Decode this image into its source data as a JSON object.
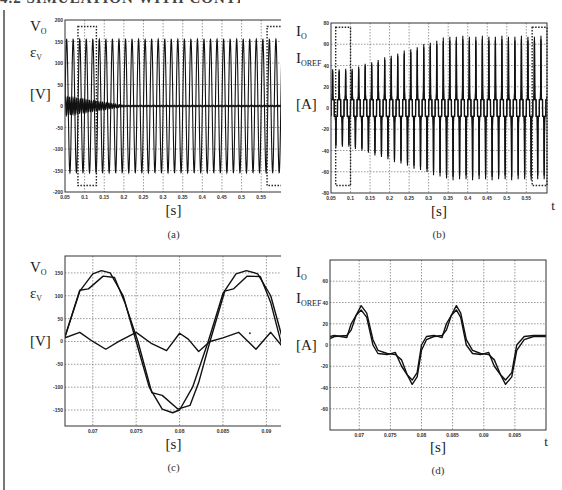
{
  "page": {
    "header_fragment": "4.2  SIMULATION WITH CONTROLLERS"
  },
  "chart_data": [
    {
      "id": "a",
      "type": "line",
      "caption": "(a)",
      "title": "",
      "ylabel_lines": [
        "V_O",
        "ε_V",
        "[V]"
      ],
      "xlabel": "[s]",
      "x_axis_symbol": "t",
      "xlim": [
        0.05,
        0.603
      ],
      "ylim": [
        -200,
        200
      ],
      "xticks": [
        0.05,
        0.1,
        0.15,
        0.2,
        0.25,
        0.3,
        0.35,
        0.4,
        0.45,
        0.5,
        0.55
      ],
      "xtick_labels": [
        "0.05",
        "0.1",
        "0.15",
        "0.2",
        "0.25",
        "0.3",
        "0.35",
        "0.4",
        "0.45",
        "0.5",
        "0.55"
      ],
      "yticks": [
        -200,
        -150,
        -100,
        -50,
        0,
        50,
        100,
        150,
        200
      ],
      "ytick_labels": [
        "-200",
        "-150",
        "-100",
        "-50",
        "0",
        "50",
        "100",
        "150",
        "200"
      ],
      "grid": true,
      "series": [
        {
          "name": "V_O",
          "description": "sinusoidal output voltage, 60 Hz, amplitude ~155 V",
          "amplitude": 155,
          "frequency_hz": 60
        },
        {
          "name": "ε_V",
          "description": "voltage error, ~±20 V initially decaying to ~0 by t≈0.2 s",
          "initial_amplitude": 20,
          "decay_end": 0.2
        }
      ],
      "annotations": [
        {
          "type": "dotted-box",
          "x": [
            0.083,
            0.13
          ],
          "y": [
            -185,
            185
          ]
        },
        {
          "type": "dotted-box",
          "x": [
            0.565,
            0.603
          ],
          "y": [
            -185,
            185
          ]
        }
      ]
    },
    {
      "id": "b",
      "type": "line",
      "caption": "(b)",
      "title": "",
      "ylabel_lines": [
        "I_O",
        "I_OREF",
        "[A]"
      ],
      "xlabel": "[s]",
      "x_axis_symbol": "t",
      "xlim": [
        0.05,
        0.603
      ],
      "ylim": [
        -80,
        80
      ],
      "xticks": [
        0.05,
        0.1,
        0.15,
        0.2,
        0.25,
        0.3,
        0.35,
        0.4,
        0.45,
        0.5,
        0.55
      ],
      "xtick_labels": [
        "0.05",
        "0.1",
        "0.15",
        "0.2",
        "0.25",
        "0.3",
        "0.35",
        "0.4",
        "0.45",
        "0.5",
        "0.55"
      ],
      "yticks": [
        -80,
        -60,
        -40,
        -20,
        0,
        20,
        40,
        60,
        80
      ],
      "ytick_labels": [
        "-80",
        "-60",
        "-40",
        "-20",
        "0",
        "20",
        "40",
        "60",
        "80"
      ],
      "grid": true,
      "series": [
        {
          "name": "I_O",
          "description": "pulsed nonlinear load current, peak ~37 A until t≈0.1 s, then growing to ~68 A by t≈0.35 s",
          "peak_start": 37,
          "peak_end": 68
        },
        {
          "name": "I_OREF",
          "description": "reference current, overlaps I_O"
        }
      ],
      "annotations": [
        {
          "type": "dotted-box",
          "x": [
            0.062,
            0.1
          ],
          "y": [
            -73,
            76
          ]
        },
        {
          "type": "dotted-box",
          "x": [
            0.565,
            0.603
          ],
          "y": [
            -73,
            76
          ]
        }
      ]
    },
    {
      "id": "c",
      "type": "line",
      "caption": "(c)",
      "title": "",
      "ylabel_lines": [
        "V_O",
        "ε_V",
        "[V]"
      ],
      "xlabel": "[s]",
      "x_axis_symbol": "t",
      "xlim": [
        0.0668,
        0.0918
      ],
      "ylim": [
        -185,
        187
      ],
      "xticks": [
        0.07,
        0.075,
        0.08,
        0.085,
        0.09
      ],
      "xtick_labels": [
        "0.07",
        "0.075",
        "0.08",
        "0.085",
        "0.09"
      ],
      "yticks": [
        -150,
        -100,
        -50,
        0,
        50,
        100,
        150
      ],
      "ytick_labels": [
        "-150",
        "-100",
        "-50",
        "0",
        "50",
        "100",
        "150"
      ],
      "grid": true,
      "series": [
        {
          "name": "V_O",
          "x": [
            0.0668,
            0.0685,
            0.07,
            0.071,
            0.072,
            0.0735,
            0.075,
            0.0765,
            0.078,
            0.0792,
            0.08,
            0.0815,
            0.0833,
            0.085,
            0.0865,
            0.0877,
            0.089,
            0.0905,
            0.0918
          ],
          "y": [
            10,
            110,
            148,
            155,
            150,
            100,
            0,
            -100,
            -148,
            -156,
            -150,
            -100,
            0,
            105,
            148,
            155,
            148,
            100,
            10
          ]
        },
        {
          "name": "V_REF",
          "x": [
            0.0668,
            0.0685,
            0.0695,
            0.0712,
            0.0725,
            0.0737,
            0.0752,
            0.0768,
            0.078,
            0.0798,
            0.0812,
            0.0822,
            0.0835,
            0.0852,
            0.0862,
            0.0878,
            0.0893,
            0.0905,
            0.0918
          ],
          "y": [
            10,
            112,
            115,
            143,
            140,
            85,
            0,
            -112,
            -118,
            -148,
            -140,
            -90,
            0,
            110,
            115,
            143,
            142,
            85,
            -10
          ]
        },
        {
          "name": "ε_V",
          "x": [
            0.0668,
            0.0685,
            0.07,
            0.0715,
            0.073,
            0.075,
            0.0768,
            0.0785,
            0.08,
            0.081,
            0.0822,
            0.0835,
            0.085,
            0.0868,
            0.0888,
            0.0905,
            0.0918
          ],
          "y": [
            8,
            20,
            0,
            -17,
            0,
            20,
            -5,
            -20,
            18,
            5,
            -22,
            0,
            8,
            20,
            -17,
            20,
            -10
          ]
        }
      ],
      "annotations": [
        {
          "type": "dot",
          "x": 0.0881,
          "y": 18
        }
      ]
    },
    {
      "id": "d",
      "type": "line",
      "caption": "(d)",
      "title": "",
      "ylabel_lines": [
        "I_O",
        "I_OREF",
        "[A]"
      ],
      "xlabel": "[s]",
      "x_axis_symbol": "t",
      "xlim": [
        0.0653,
        0.1
      ],
      "ylim": [
        -80,
        80
      ],
      "xticks": [
        0.07,
        0.075,
        0.08,
        0.085,
        0.09,
        0.095
      ],
      "xtick_labels": [
        "0.07",
        "0.075",
        "0.08",
        "0.085",
        "0.09",
        "0.095"
      ],
      "yticks": [
        -60,
        -40,
        -20,
        0,
        20,
        40,
        60
      ],
      "ytick_labels": [
        "-60",
        "-40",
        "-20",
        "0",
        "20",
        "40",
        "60"
      ],
      "grid": true,
      "series": [
        {
          "name": "I_O",
          "x": [
            0.0653,
            0.066,
            0.068,
            0.0687,
            0.0695,
            0.0703,
            0.0712,
            0.0722,
            0.073,
            0.0745,
            0.0758,
            0.0768,
            0.0777,
            0.0785,
            0.0793,
            0.08,
            0.0808,
            0.082,
            0.0833,
            0.084,
            0.0848,
            0.0856,
            0.0863,
            0.0872,
            0.0882,
            0.0895,
            0.0908,
            0.0917,
            0.0927,
            0.0935,
            0.0945,
            0.0953,
            0.0965,
            0.098,
            0.1
          ],
          "y": [
            6,
            8,
            9,
            14,
            28,
            37,
            30,
            5,
            -5,
            -8,
            -9,
            -14,
            -28,
            -37,
            -30,
            -5,
            5,
            8,
            9,
            14,
            28,
            37,
            30,
            5,
            -5,
            -8,
            -9,
            -14,
            -28,
            -37,
            -30,
            -5,
            5,
            8,
            8
          ]
        },
        {
          "name": "I_OREF",
          "x": [
            0.0653,
            0.066,
            0.068,
            0.0687,
            0.0695,
            0.0703,
            0.0712,
            0.0722,
            0.073,
            0.0745,
            0.0758,
            0.0768,
            0.0777,
            0.0785,
            0.0793,
            0.08,
            0.0808,
            0.082,
            0.0833,
            0.084,
            0.0848,
            0.0856,
            0.0863,
            0.0872,
            0.0882,
            0.0895,
            0.0908,
            0.0917,
            0.0927,
            0.0935,
            0.0945,
            0.0953,
            0.0965,
            0.098,
            0.1
          ],
          "y": [
            8,
            9,
            7,
            20,
            28,
            33,
            26,
            0,
            -8,
            -9,
            -7,
            -20,
            -28,
            -33,
            -26,
            0,
            8,
            9,
            7,
            20,
            28,
            33,
            26,
            0,
            -8,
            -9,
            -7,
            -20,
            -28,
            -33,
            -26,
            0,
            8,
            9,
            9
          ]
        }
      ]
    }
  ]
}
